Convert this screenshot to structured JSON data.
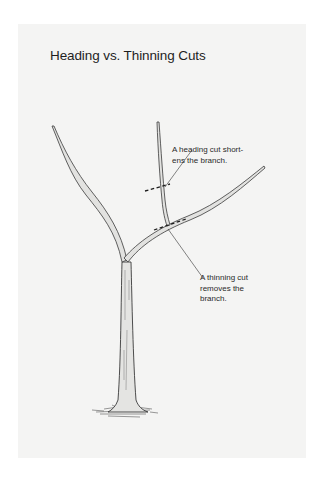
{
  "figure": {
    "title": "Heading vs. Thinning Cuts",
    "callouts": [
      {
        "id": "heading",
        "text": "A heading cut short-\nens the branch."
      },
      {
        "id": "thinning",
        "text": "A thinning cut\nremoves the\nbranch."
      }
    ],
    "colors": {
      "page_background": "#ffffff",
      "panel_background": "#f4f4f3",
      "ink": "#2a2a2a",
      "branch_fill": "#e2e2e0"
    }
  }
}
